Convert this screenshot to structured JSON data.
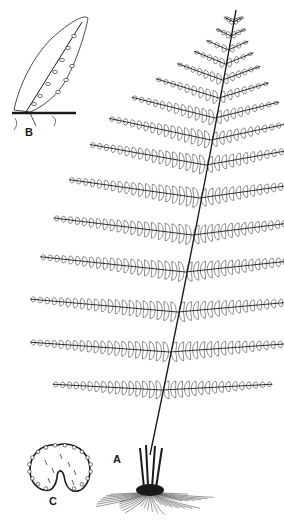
{
  "figure": {
    "type": "botanical-line-illustration",
    "ink_color": "#1a1a1a",
    "paper_color": "#ffffff",
    "labels": [
      {
        "id": "A",
        "text": "A",
        "x": 117,
        "y": 461,
        "describes": "rhizome with stipe bases and roots"
      },
      {
        "id": "B",
        "text": "B",
        "x": 29,
        "y": 134,
        "describes": "fertile pinnule with sori, enlarged"
      },
      {
        "id": "C",
        "text": "C",
        "x": 53,
        "y": 503,
        "describes": "sorus / indusium, enlarged"
      }
    ]
  },
  "frond": {
    "rachis": {
      "top": [
        236,
        10
      ],
      "bottom": [
        150,
        455
      ]
    },
    "pinnae": [
      {
        "y": 22,
        "left": 10,
        "right": 10,
        "angle": -28
      },
      {
        "y": 36,
        "left": 16,
        "right": 16,
        "angle": -26
      },
      {
        "y": 50,
        "left": 24,
        "right": 22,
        "angle": -24
      },
      {
        "y": 64,
        "left": 34,
        "right": 30,
        "angle": -22
      },
      {
        "y": 80,
        "left": 48,
        "right": 40,
        "angle": -20
      },
      {
        "y": 98,
        "left": 66,
        "right": 52,
        "angle": -17
      },
      {
        "y": 118,
        "left": 86,
        "right": 66,
        "angle": -14
      },
      {
        "y": 140,
        "left": 104,
        "right": 80,
        "angle": -12
      },
      {
        "y": 165,
        "left": 118,
        "right": 94,
        "angle": -10
      },
      {
        "y": 198,
        "left": 132,
        "right": 106,
        "angle": -8
      },
      {
        "y": 235,
        "left": 140,
        "right": 116,
        "angle": -7
      },
      {
        "y": 272,
        "left": 146,
        "right": 124,
        "angle": -6
      },
      {
        "y": 312,
        "left": 148,
        "right": 128,
        "angle": -5
      },
      {
        "y": 352,
        "left": 140,
        "right": 128,
        "angle": -4
      },
      {
        "y": 390,
        "left": 110,
        "right": 110,
        "angle": -3
      }
    ]
  }
}
